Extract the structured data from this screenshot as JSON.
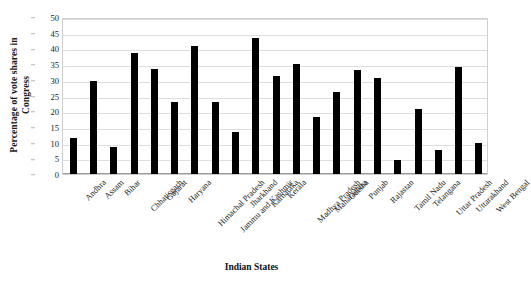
{
  "chart_data": {
    "type": "bar",
    "title": "",
    "xlabel": "Indian States",
    "ylabel": "Percentage of vote shares in Congress",
    "ylabel_line1": "Percentage of vote shares in",
    "ylabel_line2": "Congress",
    "ylim": [
      0,
      50
    ],
    "ytick_step": 5,
    "yticks": [
      0,
      5,
      10,
      15,
      20,
      25,
      30,
      35,
      40,
      45,
      50
    ],
    "grid": true,
    "grid_axis": "y",
    "legend": "none",
    "bar_color": "#000000",
    "grid_color": "#dedede",
    "categories": [
      "Andhra",
      "Assam",
      "Bihar",
      "Chhatisgarh",
      "Gujarat",
      "Haryana",
      "Himachal Pradesh",
      "Jammu and Kashmir",
      "Jharkhand",
      "Karnataka",
      "Kerala",
      "Madhya Pradesh",
      "Maharashtra",
      "Odisha",
      "Punjab",
      "Rajastan",
      "Tamil Nadu",
      "Telangana",
      "Uttar Pradesh",
      "Uttarakhand",
      "West Bengal"
    ],
    "values": [
      11.5,
      29.5,
      8.5,
      38.5,
      33.4,
      23.0,
      40.8,
      23.0,
      13.4,
      43.2,
      31.2,
      35.0,
      18.2,
      26.1,
      33.2,
      30.5,
      4.5,
      20.6,
      7.8,
      34.2,
      10.0
    ]
  }
}
